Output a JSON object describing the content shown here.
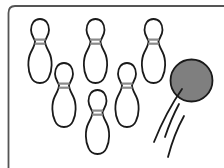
{
  "illustration": {
    "subject": "Bowling pins and ball",
    "colors": {
      "background": "#ffffff",
      "outline": "#1a1a1a",
      "frame": "#555555",
      "pin_fill": "#ffffff",
      "pin_stripe": "#8a8a8a",
      "ball_fill": "#7f7f7f"
    },
    "pin_count": 6,
    "pins": [
      {
        "id": "pin-1",
        "cx": 40,
        "top": 19,
        "height": 64
      },
      {
        "id": "pin-2",
        "cx": 95.5,
        "top": 19,
        "height": 64
      },
      {
        "id": "pin-3",
        "cx": 153.5,
        "top": 19,
        "height": 64
      },
      {
        "id": "pin-4",
        "cx": 64,
        "top": 63,
        "height": 65
      },
      {
        "id": "pin-5",
        "cx": 127,
        "top": 63,
        "height": 65
      },
      {
        "id": "pin-6",
        "cx": 97.5,
        "top": 90,
        "height": 65
      }
    ],
    "ball": {
      "cx": 191.5,
      "cy": 80.5,
      "r": 21
    },
    "motion_lines": 3
  }
}
